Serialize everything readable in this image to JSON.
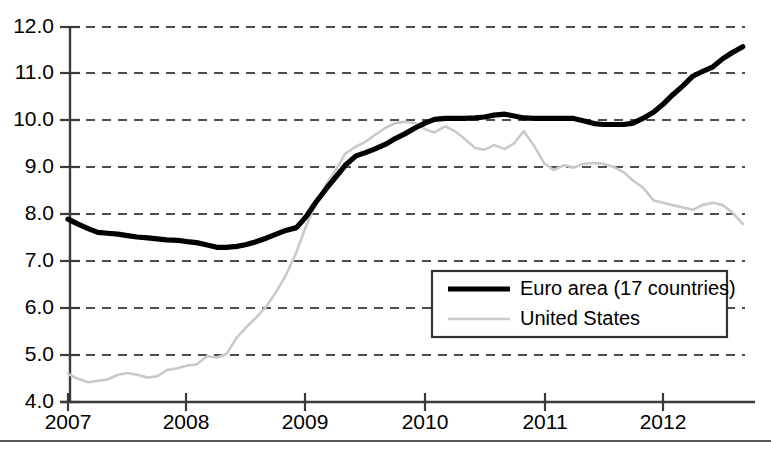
{
  "chart_data": {
    "type": "line",
    "title": "",
    "subtitle": "",
    "xlabel": "",
    "ylabel": "",
    "xlim": [
      2007.0,
      2012.7
    ],
    "ylim": [
      4.0,
      12.0
    ],
    "grid": "horizontal-dashed",
    "legend_position": "center-right-inside",
    "y_ticks": [
      "4.0",
      "5.0",
      "6.0",
      "7.0",
      "8.0",
      "9.0",
      "10.0",
      "11.0",
      "12.0"
    ],
    "y_tick_values": [
      4.0,
      5.0,
      6.0,
      7.0,
      8.0,
      9.0,
      10.0,
      11.0,
      12.0
    ],
    "x_ticks": [
      "2007",
      "2008",
      "2009",
      "2010",
      "2011",
      "2012"
    ],
    "x_tick_values": [
      2007,
      2008,
      2009,
      2010,
      2011,
      2012
    ],
    "series": [
      {
        "name": "Euro area (17 countries)",
        "color": "#000000",
        "width": 5.2,
        "x": [
          2007.0,
          2007.08,
          2007.17,
          2007.25,
          2007.33,
          2007.42,
          2007.5,
          2007.58,
          2007.67,
          2007.75,
          2007.83,
          2007.92,
          2008.0,
          2008.08,
          2008.17,
          2008.25,
          2008.33,
          2008.42,
          2008.5,
          2008.58,
          2008.67,
          2008.75,
          2008.83,
          2008.92,
          2009.0,
          2009.08,
          2009.17,
          2009.25,
          2009.33,
          2009.42,
          2009.5,
          2009.58,
          2009.67,
          2009.75,
          2009.83,
          2009.92,
          2010.0,
          2010.08,
          2010.17,
          2010.25,
          2010.33,
          2010.42,
          2010.5,
          2010.58,
          2010.67,
          2010.75,
          2010.83,
          2010.92,
          2011.0,
          2011.08,
          2011.17,
          2011.25,
          2011.33,
          2011.42,
          2011.5,
          2011.58,
          2011.67,
          2011.75,
          2011.83,
          2011.92,
          2012.0,
          2012.08,
          2012.17,
          2012.25,
          2012.33,
          2012.42,
          2012.5,
          2012.58,
          2012.67
        ],
        "values": [
          7.9,
          7.8,
          7.7,
          7.62,
          7.6,
          7.58,
          7.55,
          7.52,
          7.5,
          7.48,
          7.46,
          7.45,
          7.42,
          7.4,
          7.35,
          7.3,
          7.3,
          7.32,
          7.36,
          7.42,
          7.5,
          7.58,
          7.66,
          7.72,
          7.95,
          8.25,
          8.55,
          8.8,
          9.05,
          9.25,
          9.32,
          9.4,
          9.5,
          9.62,
          9.72,
          9.85,
          9.95,
          10.03,
          10.05,
          10.05,
          10.05,
          10.06,
          10.08,
          10.12,
          10.14,
          10.1,
          10.06,
          10.05,
          10.05,
          10.05,
          10.05,
          10.05,
          10.0,
          9.94,
          9.92,
          9.92,
          9.92,
          9.95,
          10.05,
          10.18,
          10.35,
          10.55,
          10.75,
          10.95,
          11.05,
          11.15,
          11.32,
          11.45,
          11.58
        ]
      },
      {
        "name": "United States",
        "color": "#c9c9c9",
        "width": 2.6,
        "x": [
          2007.0,
          2007.08,
          2007.17,
          2007.25,
          2007.33,
          2007.42,
          2007.5,
          2007.58,
          2007.67,
          2007.75,
          2007.83,
          2007.92,
          2008.0,
          2008.08,
          2008.17,
          2008.25,
          2008.33,
          2008.42,
          2008.5,
          2008.58,
          2008.67,
          2008.75,
          2008.83,
          2008.92,
          2009.0,
          2009.08,
          2009.17,
          2009.25,
          2009.33,
          2009.42,
          2009.5,
          2009.58,
          2009.67,
          2009.75,
          2009.83,
          2009.92,
          2010.0,
          2010.08,
          2010.17,
          2010.25,
          2010.33,
          2010.42,
          2010.5,
          2010.58,
          2010.67,
          2010.75,
          2010.83,
          2010.92,
          2011.0,
          2011.08,
          2011.17,
          2011.25,
          2011.33,
          2011.42,
          2011.5,
          2011.58,
          2011.67,
          2011.75,
          2011.83,
          2011.92,
          2012.0,
          2012.08,
          2012.17,
          2012.25,
          2012.33,
          2012.42,
          2012.5,
          2012.58,
          2012.67
        ],
        "values": [
          4.6,
          4.5,
          4.42,
          4.45,
          4.48,
          4.58,
          4.62,
          4.58,
          4.52,
          4.55,
          4.68,
          4.72,
          4.78,
          4.8,
          4.98,
          4.95,
          5.02,
          5.38,
          5.6,
          5.8,
          6.05,
          6.35,
          6.7,
          7.2,
          7.75,
          8.2,
          8.65,
          8.95,
          9.3,
          9.45,
          9.55,
          9.7,
          9.85,
          9.95,
          9.98,
          9.95,
          9.82,
          9.75,
          9.88,
          9.78,
          9.62,
          9.42,
          9.38,
          9.48,
          9.4,
          9.52,
          9.78,
          9.45,
          9.1,
          8.95,
          9.05,
          9.0,
          9.08,
          9.1,
          9.08,
          9.02,
          8.9,
          8.72,
          8.58,
          8.3,
          8.25,
          8.2,
          8.15,
          8.1,
          8.2,
          8.25,
          8.2,
          8.05,
          7.8
        ]
      }
    ],
    "legend": [
      {
        "label": "Euro area (17 countries)",
        "color": "#000000",
        "style": "thick-solid"
      },
      {
        "label": "United States",
        "color": "#c9c9c9",
        "style": "thin-solid"
      }
    ]
  },
  "colors": {
    "euro_area": "#000000",
    "united_states": "#c9c9c9",
    "axis": "#3a3a3a",
    "gridline": "#4d4d4d",
    "background": "#ffffff"
  }
}
